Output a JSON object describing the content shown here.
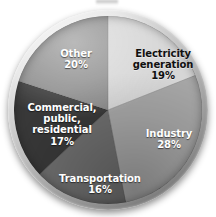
{
  "chart_data": {
    "type": "pie",
    "title": "",
    "subtitle": "",
    "xlabel": "",
    "ylabel": "",
    "units": "percent",
    "total": 100,
    "legend_position": "none",
    "labels_inside_slices": true,
    "grid": false,
    "start_angle_deg": 0,
    "direction": "clockwise",
    "categories": [
      "Electricity generation",
      "Industry",
      "Transportation",
      "Commercial, public, residential",
      "Other"
    ],
    "values": [
      19,
      28,
      16,
      17,
      20
    ],
    "value_labels": [
      "19%",
      "28%",
      "16%",
      "17%",
      "20%"
    ],
    "colors": [
      "#d6d6d6",
      "#a6a6a6",
      "#6e6e6e",
      "#383838",
      "#8c8c8c"
    ],
    "slices": [
      {
        "name": "Electricity generation",
        "value": 19,
        "value_label": "19%",
        "color": "#d6d6d6",
        "label_color": "#101010",
        "start_deg": 0,
        "end_deg": 68.4,
        "line1": "Electricity",
        "line2": "generation",
        "line3": ""
      },
      {
        "name": "Industry",
        "value": 28,
        "value_label": "28%",
        "color": "#a6a6a6",
        "label_color": "#ffffff",
        "start_deg": 68.4,
        "end_deg": 169.2,
        "line1": "Industry",
        "line2": "",
        "line3": ""
      },
      {
        "name": "Transportation",
        "value": 16,
        "value_label": "16%",
        "color": "#6e6e6e",
        "label_color": "#ffffff",
        "start_deg": 169.2,
        "end_deg": 226.8,
        "line1": "Transportation",
        "line2": "",
        "line3": ""
      },
      {
        "name": "Commercial, public, residential",
        "value": 17,
        "value_label": "17%",
        "color": "#383838",
        "label_color": "#ffffff",
        "start_deg": 226.8,
        "end_deg": 288.0,
        "line1": "Commercial,",
        "line2": "public,",
        "line3": "residential"
      },
      {
        "name": "Other",
        "value": 20,
        "value_label": "20%",
        "color": "#8c8c8c",
        "label_color": "#ffffff",
        "start_deg": 288.0,
        "end_deg": 360.0,
        "line1": "Other",
        "line2": "",
        "line3": ""
      }
    ]
  }
}
